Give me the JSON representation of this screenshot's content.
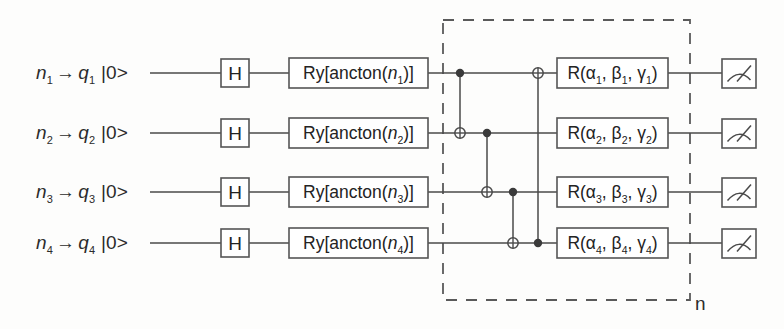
{
  "diagram": {
    "type": "quantum-circuit",
    "qubit_count": 4,
    "repeated_block_label": "n",
    "ket_state": "|0>",
    "arrow_glyph": "→",
    "colors": {
      "background": "#fdfdfc",
      "line": "#4a4a4a",
      "box_stroke": "#555555",
      "text": "#2b2b2b",
      "control_dot": "#3a3a3a",
      "dashed_box": "#5a5a5a"
    }
  },
  "wires": [
    {
      "input_label": "n",
      "input_sub": "1",
      "qubit_label": "q",
      "qubit_sub": "1",
      "ket": "|0>"
    },
    {
      "input_label": "n",
      "input_sub": "2",
      "qubit_label": "q",
      "qubit_sub": "2",
      "ket": "|0>"
    },
    {
      "input_label": "n",
      "input_sub": "3",
      "qubit_label": "q",
      "qubit_sub": "3",
      "ket": "|0>"
    },
    {
      "input_label": "n",
      "input_sub": "4",
      "qubit_label": "q",
      "qubit_sub": "4",
      "ket": "|0>"
    }
  ],
  "gates": {
    "hadamard": {
      "label": "H",
      "count": 4
    },
    "encoding": [
      {
        "prefix": "Ry[ancton(",
        "var": "n",
        "sub": "1",
        "suffix": ")]"
      },
      {
        "prefix": "Ry[ancton(",
        "var": "n",
        "sub": "2",
        "suffix": ")]"
      },
      {
        "prefix": "Ry[ancton(",
        "var": "n",
        "sub": "3",
        "suffix": ")]"
      },
      {
        "prefix": "Ry[ancton(",
        "var": "n",
        "sub": "4",
        "suffix": ")]"
      }
    ],
    "rotation": [
      {
        "prefix": "R(",
        "a": "α",
        "b": "β",
        "g": "γ",
        "sub": "1",
        "suffix": ")"
      },
      {
        "prefix": "R(",
        "a": "α",
        "b": "β",
        "g": "γ",
        "sub": "2",
        "suffix": ")"
      },
      {
        "prefix": "R(",
        "a": "α",
        "b": "β",
        "g": "γ",
        "sub": "3",
        "suffix": ")"
      },
      {
        "prefix": "R(",
        "a": "α",
        "b": "β",
        "g": "γ",
        "sub": "4",
        "suffix": ")"
      }
    ],
    "measurement": {
      "name": "meter",
      "count": 4
    }
  },
  "entanglers": [
    {
      "name": "cnot-q1-q2",
      "control_qubit": 1,
      "target_qubit": 2
    },
    {
      "name": "cnot-q2-q3",
      "control_qubit": 2,
      "target_qubit": 3
    },
    {
      "name": "cnot-q3-q4",
      "control_qubit": 3,
      "target_qubit": 4
    },
    {
      "name": "cnot-q4-q1",
      "control_qubit": 4,
      "target_qubit": 1
    }
  ]
}
